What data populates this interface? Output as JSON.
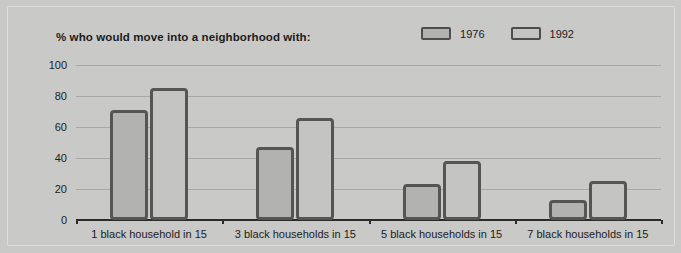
{
  "chart_data": {
    "type": "bar",
    "title": "% who would move into a neighborhood with:",
    "xlabel": "",
    "ylabel": "",
    "ylim": [
      0,
      100
    ],
    "yticks": [
      0,
      20,
      40,
      60,
      80,
      100
    ],
    "grid": true,
    "legend_position": "top-right",
    "categories": [
      "1 black household in 15",
      "3 black households in 15",
      "5 black households in 15",
      "7 black households in 15"
    ],
    "series": [
      {
        "name": "1976",
        "values": [
          71,
          47,
          23,
          13
        ],
        "color": "#b2b2b0"
      },
      {
        "name": "1992",
        "values": [
          85,
          66,
          38,
          25
        ],
        "color": "#c4c4c2"
      }
    ]
  },
  "legend": {
    "items": [
      {
        "label": "1976"
      },
      {
        "label": "1992"
      }
    ]
  },
  "axis": {
    "ytick_labels": [
      "100",
      "80",
      "60",
      "40",
      "20",
      "0"
    ]
  }
}
